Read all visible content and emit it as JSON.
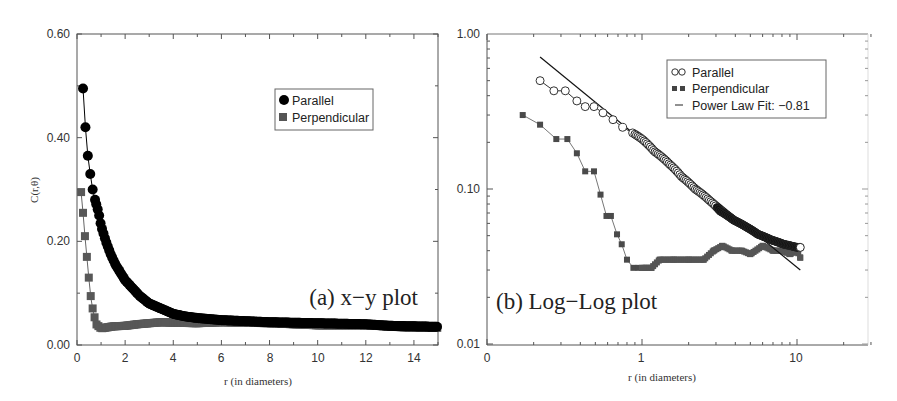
{
  "chart_data": [
    {
      "id": "a",
      "type": "scatter",
      "panel_label": "(a) x−y plot",
      "title": "",
      "xlabel": "r (in diameters)",
      "ylabel": "C(r,θ)",
      "xlim": [
        0,
        15
      ],
      "ylim": [
        0.0,
        0.6
      ],
      "x_ticks": [
        0,
        2,
        4,
        6,
        8,
        10,
        12,
        14
      ],
      "y_ticks": [
        0.0,
        0.2,
        0.4,
        0.6
      ],
      "y_tick_labels": [
        "0.00",
        "0.20",
        "0.40",
        "0.60"
      ],
      "grid": false,
      "legend_position": "upper right (inset)",
      "series": [
        {
          "name": "Parallel",
          "marker": "filled circle",
          "color": "#000000",
          "x": [
            0.25,
            0.35,
            0.45,
            0.55,
            0.65,
            0.75,
            0.9,
            1.0,
            1.2,
            1.4,
            1.6,
            1.8,
            2.0,
            2.3,
            2.6,
            3.0,
            3.5,
            4.0,
            4.5,
            5.0,
            6.0,
            7.0,
            8.0,
            9.0,
            10.0,
            11.0,
            12.0,
            13.0,
            14.0,
            15.0
          ],
          "y": [
            0.495,
            0.42,
            0.365,
            0.33,
            0.3,
            0.28,
            0.255,
            0.23,
            0.2,
            0.175,
            0.155,
            0.14,
            0.125,
            0.11,
            0.095,
            0.08,
            0.07,
            0.06,
            0.055,
            0.052,
            0.048,
            0.046,
            0.044,
            0.043,
            0.042,
            0.041,
            0.04,
            0.037,
            0.036,
            0.035
          ]
        },
        {
          "name": "Perpendicular",
          "marker": "filled square",
          "color": "#555555",
          "x": [
            0.17,
            0.25,
            0.33,
            0.42,
            0.5,
            0.58,
            0.67,
            0.8,
            1.0,
            1.5,
            2.0,
            2.5,
            3.0,
            3.5,
            4.0,
            5.0,
            6.0,
            8.0,
            10.0,
            12.0,
            14.0,
            15.0
          ],
          "y": [
            0.295,
            0.255,
            0.21,
            0.165,
            0.125,
            0.09,
            0.065,
            0.04,
            0.032,
            0.036,
            0.037,
            0.04,
            0.042,
            0.044,
            0.043,
            0.042,
            0.044,
            0.042,
            0.038,
            0.038,
            0.033,
            0.033
          ]
        }
      ]
    },
    {
      "id": "b",
      "type": "scatter",
      "panel_label": "(b) Log−Log plot",
      "title": "",
      "xlabel": "r (in diameters)",
      "ylabel": "",
      "xscale": "log",
      "yscale": "log",
      "xlim": [
        0.1,
        30
      ],
      "ylim": [
        0.01,
        1.0
      ],
      "x_tick_labels": [
        "0",
        "1",
        "10"
      ],
      "x_tick_values": [
        0.1,
        1,
        10
      ],
      "y_tick_labels": [
        "0.01",
        "0.10",
        "1.00"
      ],
      "y_tick_values": [
        0.01,
        0.1,
        1.0
      ],
      "grid": false,
      "legend_position": "upper right (inset)",
      "series": [
        {
          "name": "Parallel",
          "marker": "open circle",
          "line": true,
          "color": "#000000",
          "x": [
            0.22,
            0.27,
            0.32,
            0.38,
            0.43,
            0.49,
            0.56,
            0.65,
            0.75,
            0.87,
            1.0,
            1.2,
            1.5,
            1.8,
            2.2,
            2.7,
            3.2,
            3.9,
            4.7,
            5.6,
            6.8,
            8.2,
            10.0,
            10.5
          ],
          "y": [
            0.5,
            0.43,
            0.43,
            0.37,
            0.34,
            0.34,
            0.31,
            0.28,
            0.25,
            0.23,
            0.21,
            0.175,
            0.145,
            0.12,
            0.1,
            0.085,
            0.072,
            0.063,
            0.057,
            0.051,
            0.047,
            0.044,
            0.042,
            0.042
          ]
        },
        {
          "name": "Perpendicular",
          "marker": "filled square",
          "line": true,
          "color": "#555555",
          "x": [
            0.17,
            0.22,
            0.28,
            0.33,
            0.38,
            0.43,
            0.49,
            0.54,
            0.59,
            0.63,
            0.69,
            0.74,
            0.8,
            0.88,
            0.95,
            1.05,
            1.15,
            1.3,
            1.6,
            2.0,
            2.5,
            2.9,
            3.3,
            3.8,
            4.4,
            5.0,
            6.0,
            7.0,
            8.0,
            9.0,
            10.0,
            10.5
          ],
          "y": [
            0.3,
            0.26,
            0.21,
            0.21,
            0.17,
            0.13,
            0.13,
            0.092,
            0.067,
            0.067,
            0.051,
            0.044,
            0.035,
            0.031,
            0.031,
            0.031,
            0.031,
            0.035,
            0.035,
            0.035,
            0.035,
            0.04,
            0.043,
            0.04,
            0.04,
            0.038,
            0.043,
            0.04,
            0.04,
            0.038,
            0.04,
            0.036
          ]
        },
        {
          "name": "Power Law Fit: −0.81",
          "marker": "none",
          "line": true,
          "color": "#000000",
          "exponent": -0.81,
          "x": [
            0.22,
            10.5
          ],
          "y": [
            0.71,
            0.03
          ]
        }
      ]
    }
  ],
  "panels": {
    "a": {
      "ylabel": "C(r,θ)",
      "xlabel": "r (in diameters)",
      "panel_label": "(a) x−y plot",
      "x_tick_labels": [
        "0",
        "2",
        "4",
        "6",
        "8",
        "10",
        "12",
        "14"
      ],
      "y_tick_labels": [
        "0.00",
        "0.20",
        "0.40",
        "0.60"
      ],
      "legend": [
        "Parallel",
        "Perpendicular"
      ]
    },
    "b": {
      "xlabel": "r (in diameters)",
      "panel_label": "(b) Log−Log plot",
      "x_tick_labels": [
        "0",
        "1",
        "10"
      ],
      "y_tick_labels": [
        "0.01",
        "0.10",
        "1.00"
      ],
      "legend": [
        "Parallel",
        "Perpendicular",
        "Power Law Fit: −0.81"
      ]
    }
  }
}
